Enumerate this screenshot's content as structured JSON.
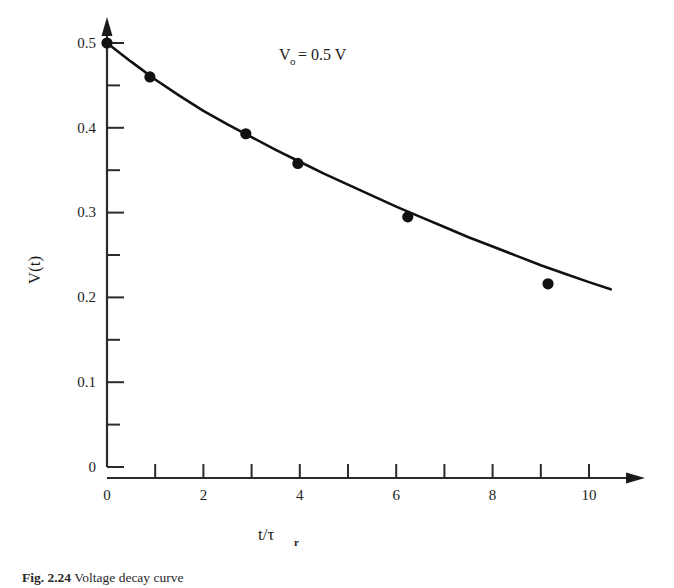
{
  "figure": {
    "annotation": "V₀ = 0.5 V",
    "annotation_parts": {
      "symbol": "V",
      "subscript": "o",
      "equals_value": "= 0.5 V"
    },
    "caption_label": "Fig. 2.24",
    "caption_text": "Voltage decay curve"
  },
  "chart_data": {
    "type": "line",
    "title": "",
    "xlabel": "t/τr",
    "xlabel_parts": {
      "main": "t/τ",
      "subscript": "r"
    },
    "ylabel": "V(t)",
    "xlim": [
      0,
      10.6
    ],
    "ylim": [
      0,
      0.52
    ],
    "grid": false,
    "legend": "none",
    "annotations": [
      {
        "text": "V₀ = 0.5 V",
        "x": 4.0,
        "y": 0.49
      }
    ],
    "x_ticks_major": [
      0,
      1,
      2,
      3,
      4,
      5,
      6,
      7,
      8,
      9,
      10
    ],
    "x_tick_labels": [
      {
        "value": 0,
        "label": "0"
      },
      {
        "value": 2,
        "label": "2"
      },
      {
        "value": 4,
        "label": "4"
      },
      {
        "value": 6,
        "label": "6"
      },
      {
        "value": 8,
        "label": "8"
      },
      {
        "value": 10,
        "label": "10"
      }
    ],
    "y_ticks_major": [
      0,
      0.05,
      0.1,
      0.15,
      0.2,
      0.25,
      0.3,
      0.35,
      0.4,
      0.45,
      0.5
    ],
    "y_tick_labels": [
      {
        "value": 0,
        "label": "0"
      },
      {
        "value": 0.1,
        "label": "0.1"
      },
      {
        "value": 0.2,
        "label": "0.2"
      },
      {
        "value": 0.3,
        "label": "0.3"
      },
      {
        "value": 0.4,
        "label": "0.4"
      },
      {
        "value": 0.5,
        "label": "0.5"
      }
    ],
    "series": [
      {
        "name": "V(t)",
        "marker": "filled-circle",
        "color": "#111111",
        "x": [
          0,
          0.89,
          2.88,
          3.96,
          6.24,
          9.15
        ],
        "y": [
          0.5,
          0.46,
          0.393,
          0.358,
          0.295,
          0.216
        ]
      },
      {
        "name": "fit-curve",
        "marker": "none",
        "color": "#111111",
        "x": [
          0,
          0.5,
          1,
          1.5,
          2,
          2.5,
          3,
          3.5,
          4,
          4.5,
          5,
          5.5,
          6,
          6.5,
          7,
          7.5,
          8,
          8.5,
          9,
          9.5,
          10,
          10.45
        ],
        "y": [
          0.5,
          0.478,
          0.457,
          0.438,
          0.42,
          0.404,
          0.389,
          0.374,
          0.36,
          0.346,
          0.333,
          0.32,
          0.307,
          0.295,
          0.283,
          0.271,
          0.26,
          0.249,
          0.238,
          0.228,
          0.218,
          0.2095
        ]
      }
    ]
  }
}
